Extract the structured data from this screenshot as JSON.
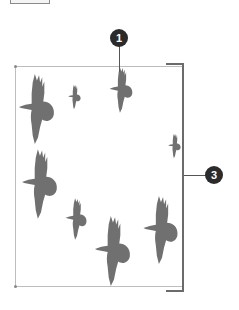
{
  "callouts": [
    {
      "id": "callout-1",
      "label": "1"
    },
    {
      "id": "callout-3",
      "label": "3"
    }
  ],
  "colors": {
    "bird": "#707070",
    "frame": "#bdbdbd",
    "bracket": "#6b6b6b",
    "callout_bg": "#2b2b2b",
    "callout_text": "#ffffff"
  },
  "illustration": {
    "subject": "flock of birds in flight",
    "bird_count": 8
  }
}
